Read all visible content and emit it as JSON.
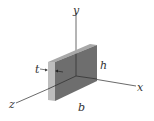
{
  "figure": {
    "axes": {
      "x_label": "x",
      "y_label": "y",
      "z_label": "z"
    },
    "dimensions": {
      "thickness_label": "t",
      "height_label": "h",
      "width_label": "b"
    },
    "colors": {
      "front_face": "#6e6e6e",
      "top_face": "#9a9a9a",
      "side_face": "#b8b8b8",
      "axis_line": "#444444",
      "label": "#333333"
    }
  }
}
